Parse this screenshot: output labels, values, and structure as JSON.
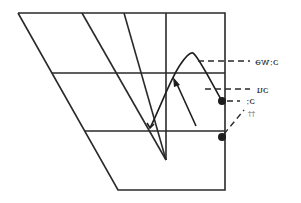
{
  "diagram": {
    "type": "vowel-quadrilateral",
    "labels": [
      {
        "id": "label-owa",
        "text": "ɔːwə"
      },
      {
        "id": "label-ou",
        "text": "ɔu"
      },
      {
        "id": "label-o-long",
        "text": "ɔː"
      },
      {
        "id": "label-dagger",
        "text": "††"
      }
    ],
    "colors": {
      "line": "#2a2a2a",
      "background": "#ffffff"
    }
  }
}
